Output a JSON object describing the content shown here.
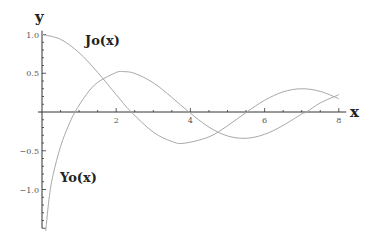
{
  "chart_data": {
    "type": "line",
    "title": "",
    "xlabel": "x",
    "ylabel": "y",
    "xlim": [
      0,
      8.2
    ],
    "ylim": [
      -1.5,
      1.05
    ],
    "x_ticks": [
      2,
      4,
      6,
      8
    ],
    "x_tick_labels": [
      "2",
      "4",
      "6",
      "8"
    ],
    "y_ticks": [
      1.0,
      0.5,
      -0.5,
      -1.0
    ],
    "y_tick_labels": [
      "1.0",
      "0.5",
      "−0.5",
      "−1.0"
    ],
    "grid": false,
    "series": [
      {
        "name": "Jo(x)",
        "function": "Bessel J0",
        "x": [
          0,
          0.5,
          1,
          1.5,
          2,
          2.4,
          3,
          3.5,
          3.83,
          4.5,
          5,
          5.52,
          6,
          6.5,
          7,
          7.5,
          8
        ],
        "values": [
          1.0,
          0.938,
          0.765,
          0.512,
          0.224,
          0.003,
          -0.26,
          -0.38,
          -0.403,
          -0.321,
          -0.178,
          0.0,
          0.151,
          0.26,
          0.3,
          0.266,
          0.172
        ]
      },
      {
        "name": "Yo(x)",
        "function": "Bessel Y0",
        "x": [
          0.1,
          0.2,
          0.3,
          0.5,
          0.7,
          0.89,
          1.2,
          1.5,
          2,
          2.2,
          2.5,
          3,
          3.5,
          3.96,
          4.5,
          5,
          5.5,
          6,
          6.5,
          7,
          7.13,
          7.5,
          8
        ],
        "values": [
          -1.534,
          -1.081,
          -0.807,
          -0.445,
          -0.191,
          0.0,
          0.228,
          0.382,
          0.51,
          0.521,
          0.498,
          0.377,
          0.189,
          0.0,
          -0.195,
          -0.309,
          -0.339,
          -0.288,
          -0.173,
          -0.026,
          0.0,
          0.117,
          0.223
        ]
      }
    ],
    "annotations": [
      {
        "text": "Jo(x)",
        "near": "upper-left, beside Jo curve"
      },
      {
        "text": "Yo(x)",
        "near": "lower-left, beside Yo curve"
      }
    ],
    "legend": "none"
  }
}
